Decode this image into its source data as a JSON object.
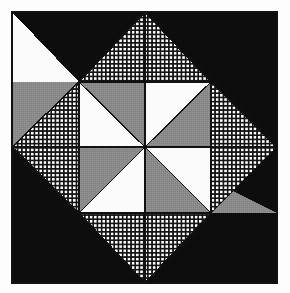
{
  "figure": {
    "kind": "quilt-block-diagram",
    "canvas": {
      "width": 290,
      "height": 293
    },
    "page_background": "#fdfdfd"
  },
  "palette": {
    "dark": "#0b0b0b",
    "gray": "#8a8a8a",
    "white": "#fbfbfb",
    "grid_background": "#fdfdfd",
    "grid_line": "#141414",
    "outline": "#111111"
  },
  "geometry": {
    "block_left": 12,
    "block_top": 12,
    "block_right": 277,
    "block_bottom": 283,
    "mid_x": 145,
    "mid_y": 147,
    "outline_width": 1.6,
    "grid_cell": 4.2,
    "grid_line_width": 1.5
  },
  "structure": {
    "quadrant_count": 4,
    "quadrants": [
      {
        "id": "top-left",
        "dark_label": "black-corner",
        "grid_triangle_direction": "up",
        "gray_blade": "pointing-right",
        "white_triangle": "inner-right"
      },
      {
        "id": "top-right",
        "dark_label": "black-corner",
        "grid_triangle_direction": "right",
        "gray_blade": "pointing-down",
        "white_triangle": "inner-bottom"
      },
      {
        "id": "bottom-right",
        "dark_label": "black-corner",
        "grid_triangle_direction": "down",
        "gray_blade": "pointing-left",
        "white_triangle": "inner-left"
      },
      {
        "id": "bottom-left",
        "dark_label": "black-corner",
        "grid_triangle_direction": "left",
        "gray_blade": "pointing-up",
        "white_triangle": "inner-top"
      }
    ],
    "center_pinwheel": {
      "blade_count": 8,
      "alternating_fills": [
        "gray",
        "white"
      ],
      "rotation": "clockwise"
    }
  },
  "shapes": {
    "dark_regions": [
      {
        "name": "dark-top-left",
        "points": "12,12 145,12 145,82 79,82"
      },
      {
        "name": "dark-top-right",
        "points": "145,12 277,12 277,147 211,147 211,82"
      },
      {
        "name": "dark-bottom-right",
        "points": "277,147 277,283 145,283 145,213 211,213"
      },
      {
        "name": "dark-bottom-left",
        "points": "12,147 79,147 79,213 145,213 145,283 12,283"
      }
    ],
    "grid_triangles": [
      {
        "name": "grid-triangle-up",
        "points": "79,82 145,12 211,82"
      },
      {
        "name": "grid-triangle-right",
        "points": "211,82 277,147 211,213"
      },
      {
        "name": "grid-triangle-down",
        "points": "211,213 145,283 79,213"
      },
      {
        "name": "grid-triangle-left",
        "points": "79,213 12,147 79,82"
      }
    ],
    "gray_blades": [
      {
        "name": "gray-blade-left",
        "points": "12,82 145,82 145,147"
      },
      {
        "name": "gray-blade-top",
        "points": "145,12 211,82 211,147 145,147"
      },
      {
        "name": "gray-blade-right",
        "points": "277,213 145,213 145,147"
      },
      {
        "name": "gray-blade-bottom",
        "points": "145,283 79,213 79,147 145,147"
      }
    ],
    "white_triangles": [
      {
        "name": "white-triangle-top-left-inner",
        "points": "145,82 211,82 145,147"
      },
      {
        "name": "white-triangle-top-right-inner",
        "points": "211,147 211,213 145,147"
      },
      {
        "name": "white-triangle-bottom-right-inner",
        "points": "145,213 79,213 145,147"
      },
      {
        "name": "white-triangle-bottom-left-inner",
        "points": "79,147 79,82 145,147"
      }
    ],
    "gray_quadrant_fills": [
      {
        "name": "gray-fill-top-left",
        "points": "12,82 79,82 12,147"
      }
    ]
  },
  "labels": {
    "alt_text": "Square quilt block with four black corners, four white-grid triangles and a gray and white central pinwheel",
    "caption": ""
  }
}
